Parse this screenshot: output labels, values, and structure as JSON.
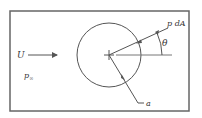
{
  "diagram": {
    "labels": {
      "velocity": "U",
      "pressure_inf": "p",
      "pressure_inf_sub": "∞",
      "pressure_force": "p dA",
      "angle": "θ",
      "radius": "a"
    },
    "colors": {
      "stroke": "#555555",
      "frame": "#666666",
      "text": "#333333",
      "background": "#ffffff"
    }
  }
}
